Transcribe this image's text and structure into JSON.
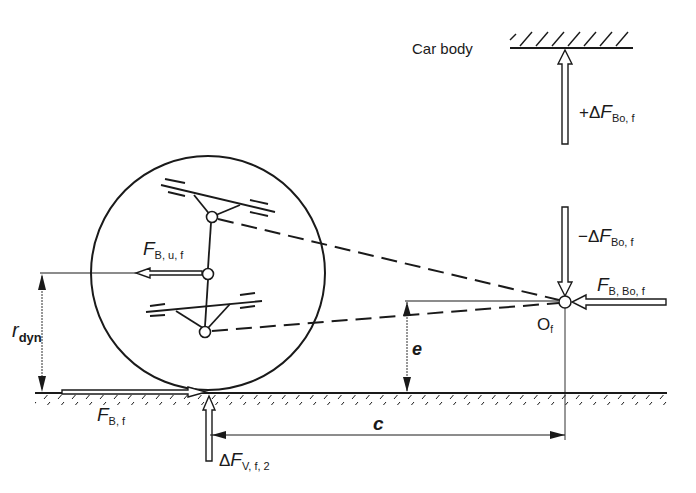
{
  "diagram": {
    "labels": {
      "car_body": "Car body",
      "plus_delta_f_bo_f": {
        "prefix": "+Δ",
        "main": "F",
        "sub": "Bo, f"
      },
      "minus_delta_f_bo_f": {
        "prefix": "−Δ",
        "main": "F",
        "sub": "Bo, f"
      },
      "f_b_bo_f": {
        "main": "F",
        "sub": "B, Bo, f"
      },
      "o_f": {
        "main": "O",
        "sub": "f"
      },
      "f_b_u_f": {
        "main": "F",
        "sub": "B, u, f"
      },
      "r_dyn": {
        "main": "r",
        "sub": "dyn"
      },
      "e": "e",
      "c": "c",
      "f_b_f": {
        "main": "F",
        "sub": "B, f"
      },
      "delta_f_v_f_2": {
        "prefix": "Δ",
        "main": "F",
        "sub": "V, f, 2"
      }
    },
    "elements": {
      "wheel": "circle",
      "upper_control_arm": "triangular wishbone",
      "lower_control_arm": "triangular wishbone",
      "pitch_pole": "O_f",
      "ground": "hatched line",
      "car_body": "hatched line"
    },
    "colors": {
      "ink": "#1a1a1a",
      "background": "#ffffff"
    }
  }
}
